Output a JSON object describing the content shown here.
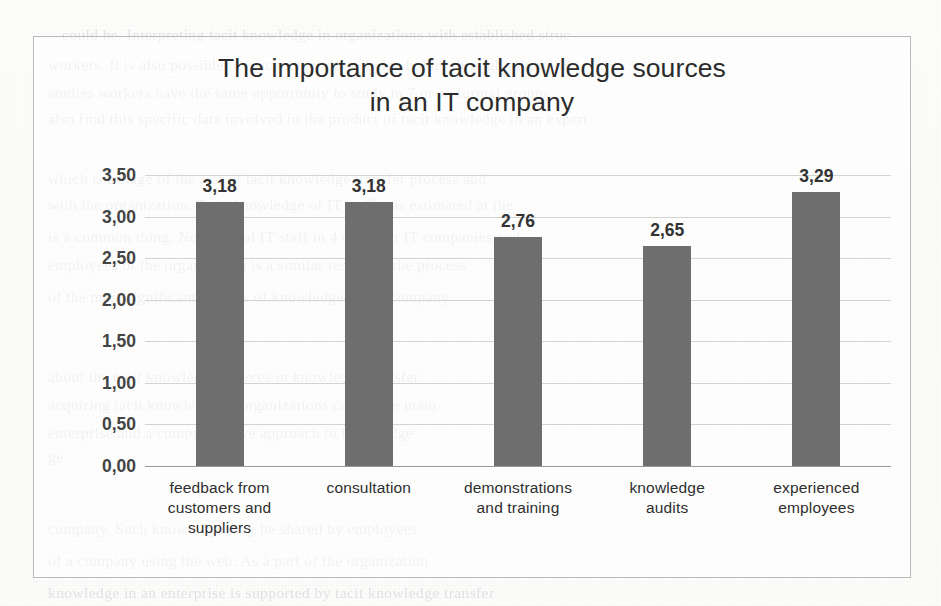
{
  "chart_data": {
    "type": "bar",
    "title": "The importance of tacit knowledge sources in an IT company",
    "title_line1": "The importance of tacit knowledge sources",
    "title_line2": "in an IT company",
    "categories": [
      "feedback from customers and suppliers",
      "consultation",
      "demonstrations and training",
      "knowledge audits",
      "experienced employees"
    ],
    "category_lines": [
      [
        "feedback from",
        "customers and",
        "suppliers"
      ],
      [
        "consultation"
      ],
      [
        "demonstrations",
        "and training"
      ],
      [
        "knowledge",
        "audits"
      ],
      [
        "experienced",
        "employees"
      ]
    ],
    "values": [
      3.18,
      3.18,
      2.76,
      2.65,
      3.29
    ],
    "value_labels": [
      "3,18",
      "3,18",
      "2,76",
      "2,65",
      "3,29"
    ],
    "xlabel": "",
    "ylabel": "",
    "ylim": [
      0,
      3.5
    ],
    "ytick_values": [
      3.5,
      3.0,
      2.5,
      2.0,
      1.5,
      1.0,
      0.5,
      0.0
    ],
    "ytick_labels": [
      "3,50",
      "3,00",
      "2,50",
      "2,00",
      "1,50",
      "1,00",
      "0,50",
      "0,00"
    ],
    "grid": true,
    "legend": false,
    "bar_color": "#6e6e6e",
    "gridline_color": "#d3d3d3",
    "frame_color": "#b9b9b9",
    "decimal_separator": ","
  },
  "background": {
    "ghost_lines": [
      {
        "text": "could be. Interpreting tacit knowledge in organizations with established struc",
        "x": 62,
        "y": 26
      },
      {
        "text": "workers. It is also possible to reach a tacit knowledge holder through asking the",
        "x": 48,
        "y": 56
      },
      {
        "text": "studies workers have the same opportunity to study in 7 or so formal groups",
        "x": 48,
        "y": 84
      },
      {
        "text": "also find this specific data involved in the product of tacit knowledge in an expert",
        "x": 48,
        "y": 110
      },
      {
        "text": "which is a stage of the rest of tacit knowledge transfer process and",
        "x": 48,
        "y": 170
      },
      {
        "text": "with the organization. Tacit knowledge of IT staff was estimated at the",
        "x": 48,
        "y": 196
      },
      {
        "text": "is a common thing. Non-formal IT staff in 4 different IT companies and",
        "x": 48,
        "y": 228
      },
      {
        "text": "employees of the organization is a similar result for the process",
        "x": 48,
        "y": 256
      },
      {
        "text": "of the most significant sources of knowledge in the company",
        "x": 48,
        "y": 288
      },
      {
        "text": "about the tacit knowledge sources in knowledge transfer",
        "x": 48,
        "y": 368
      },
      {
        "text": "acquiring tacit knowledge in organizations can be the main",
        "x": 48,
        "y": 396
      },
      {
        "text": "enterprise and a comprehensive approach to knowledge",
        "x": 48,
        "y": 424
      },
      {
        "text": "ge",
        "x": 48,
        "y": 448
      },
      {
        "text": "company. Such knowledge may be shared by employees",
        "x": 48,
        "y": 520
      },
      {
        "text": "of a company using the web. As a part of the organization",
        "x": 48,
        "y": 552
      },
      {
        "text": "knowledge in an enterprise is supported by tacit knowledge transfer",
        "x": 48,
        "y": 584
      }
    ]
  }
}
